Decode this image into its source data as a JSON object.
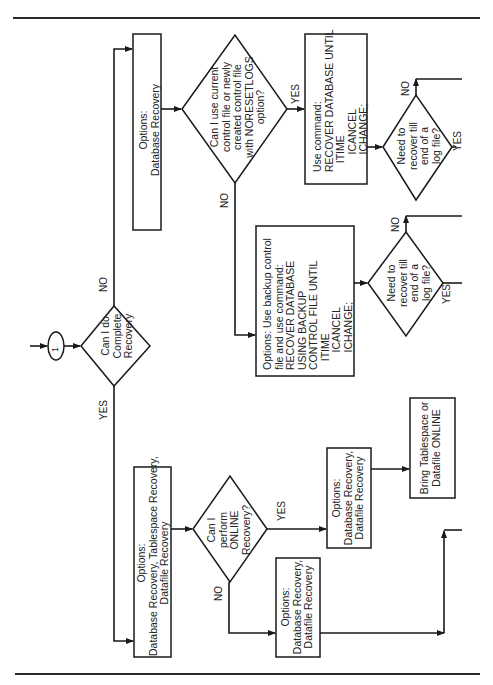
{
  "flowchart": {
    "orientation": "rotated-90-ccw",
    "start_connector": {
      "label": "1"
    },
    "nodes": {
      "complete_recovery": {
        "type": "decision",
        "text": "Can I do\nComplete\nRecovery"
      },
      "options_db_recovery": {
        "type": "process",
        "text": "Options:\nDatabase Recovery"
      },
      "current_controlfile_q": {
        "type": "decision",
        "text": "Can I use current\ncontrol file or newly\ncreated control file\nwith NORESETLOGS\noption?"
      },
      "use_command": {
        "type": "process",
        "text": "Use command:\nRECOVER DATABASE UNTIL\n   ITIME\n      ICANCEL\n      ICHANGE;"
      },
      "need_recover_1": {
        "type": "decision",
        "text": "Need to\nrecover till\nend of a\nlog file?"
      },
      "backup_controlfile": {
        "type": "process",
        "text": "Options: Use backup control\nfile and use command:\nRECOVER DATABASE\nUSING BACKUP\nCONTROL FILE UNTIL\n   ITIME\n      ICANCEL\n      ICHANGE;"
      },
      "need_recover_2": {
        "type": "decision",
        "text": "Need to\nrecover till\nend of a\nlog file?"
      },
      "options_all": {
        "type": "process",
        "text": "Options:\nDatabase Recovery, Tablespace Recovery,\nDatafile Recovery"
      },
      "online_q": {
        "type": "decision",
        "text": "Can I\nperform\nONLINE\nRecovery?"
      },
      "options_online_yes": {
        "type": "process",
        "text": "Options:\nDatabase Recovery,\nDatafile Recovery"
      },
      "bring_online": {
        "type": "process",
        "text": "Bring Tablespace or\nDatafile ONLINE"
      },
      "options_online_no": {
        "type": "process",
        "text": "Options:\nDatabase Recovery,\nDatafile Recovery"
      }
    },
    "edge_labels": {
      "complete_no": "NO",
      "complete_yes": "YES",
      "controlfile_yes": "YES",
      "controlfile_no": "NO",
      "need1_no": "NO",
      "need1_yes": "YES",
      "need2_no": "NO",
      "need2_yes": "YES",
      "online_yes": "YES",
      "online_no": "NO"
    },
    "colors": {
      "stroke": "#1a1a1a",
      "background": "#ffffff",
      "text": "#222222"
    }
  }
}
